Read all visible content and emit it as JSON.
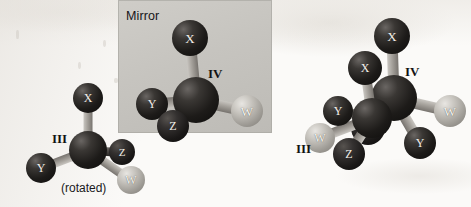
{
  "figure": {
    "width": 471,
    "height": 207,
    "background_color": "#fbfaf8",
    "description_type": "stereochemistry-mirror-image-figure"
  },
  "mirror": {
    "label": "Mirror",
    "plane_color": "#c6c4bf",
    "x": 118,
    "y": 0,
    "width": 154,
    "height": 133,
    "label_x": 126,
    "label_y": 9
  },
  "colors": {
    "dark_atom": "#1d1b19",
    "light_atom": "#c6c3bd",
    "bond_gray": "#a6a29c",
    "bond_dark": "#4a4744",
    "text_dark": "#131214"
  },
  "labels": [
    {
      "name": "label-III-left",
      "text": "III",
      "x": 52,
      "y": 131,
      "size": 13,
      "kind": "roman"
    },
    {
      "name": "caption-rotated",
      "text": "(rotated)",
      "x": 61,
      "y": 181,
      "size": 12,
      "kind": "caption"
    },
    {
      "name": "label-IV-middle",
      "text": "IV",
      "x": 208,
      "y": 66,
      "size": 13,
      "kind": "roman"
    },
    {
      "name": "label-IV-right",
      "text": "IV",
      "x": 405,
      "y": 64,
      "size": 13,
      "kind": "roman"
    },
    {
      "name": "label-III-right",
      "text": "III",
      "x": 296,
      "y": 141,
      "size": 13,
      "kind": "roman"
    }
  ],
  "molecules": [
    {
      "id": "III-left",
      "name": "molecule-iii-rotated",
      "label": "III",
      "caption": "(rotated)",
      "center_atom": {
        "name": "carbon-center",
        "label": "",
        "x": 88,
        "y": 150,
        "r": 19,
        "shade": "dark"
      },
      "substituents": [
        {
          "name": "atom-X",
          "label": "X",
          "x": 88,
          "y": 98,
          "r": 15,
          "shade": "dark",
          "font": 12,
          "bond": "gray"
        },
        {
          "name": "atom-Y",
          "label": "Y",
          "x": 41,
          "y": 168,
          "r": 15,
          "shade": "dark",
          "font": 12,
          "bond": "gray"
        },
        {
          "name": "atom-Z",
          "label": "Z",
          "x": 122,
          "y": 152,
          "r": 13,
          "shade": "mid",
          "font": 11,
          "bond": "dark"
        },
        {
          "name": "atom-W",
          "label": "W",
          "x": 131,
          "y": 180,
          "r": 14,
          "shade": "light",
          "font": 12,
          "bond": "gray"
        }
      ]
    },
    {
      "id": "IV-middle",
      "name": "molecule-iv-mirror-image",
      "label": "IV",
      "caption": "",
      "center_atom": {
        "name": "carbon-center",
        "label": "",
        "x": 196,
        "y": 100,
        "r": 23,
        "shade": "dark"
      },
      "substituents": [
        {
          "name": "atom-X",
          "label": "X",
          "x": 190,
          "y": 38,
          "r": 18,
          "shade": "dark",
          "font": 13,
          "bond": "gray"
        },
        {
          "name": "atom-Y",
          "label": "Y",
          "x": 152,
          "y": 104,
          "r": 16,
          "shade": "dark",
          "font": 12,
          "bond": "gray"
        },
        {
          "name": "atom-Z",
          "label": "Z",
          "x": 173,
          "y": 126,
          "r": 16,
          "shade": "mid",
          "font": 12,
          "bond": "gray"
        },
        {
          "name": "atom-W",
          "label": "W",
          "x": 247,
          "y": 111,
          "r": 16,
          "shade": "light",
          "font": 13,
          "bond": "gray"
        }
      ]
    },
    {
      "id": "IV-right",
      "name": "molecule-iv-overlapped",
      "label": "IV",
      "caption": "",
      "center_atom": {
        "name": "carbon-center",
        "label": "",
        "x": 394,
        "y": 98,
        "r": 23,
        "shade": "dark"
      },
      "substituents": [
        {
          "name": "atom-X",
          "label": "X",
          "x": 392,
          "y": 36,
          "r": 18,
          "shade": "dark",
          "font": 13,
          "bond": "gray"
        },
        {
          "name": "atom-Y",
          "label": "Y",
          "x": 420,
          "y": 143,
          "r": 16,
          "shade": "dark",
          "font": 12,
          "bond": "gray"
        },
        {
          "name": "atom-Z",
          "label": "Z",
          "x": 368,
          "y": 128,
          "r": 17,
          "shade": "mid",
          "font": 12,
          "bond": "dark"
        },
        {
          "name": "atom-W",
          "label": "W",
          "x": 450,
          "y": 111,
          "r": 16,
          "shade": "light",
          "font": 13,
          "bond": "gray"
        }
      ]
    },
    {
      "id": "III-right",
      "name": "molecule-iii-overlapped",
      "label": "III",
      "caption": "",
      "center_atom": {
        "name": "carbon-center",
        "label": "",
        "x": 372,
        "y": 118,
        "r": 20,
        "shade": "dark"
      },
      "substituents": [
        {
          "name": "atom-X",
          "label": "X",
          "x": 365,
          "y": 68,
          "r": 17,
          "shade": "dark",
          "font": 12,
          "bond": "gray"
        },
        {
          "name": "atom-Y",
          "label": "Y",
          "x": 338,
          "y": 111,
          "r": 15,
          "shade": "dark",
          "font": 12,
          "bond": "gray"
        },
        {
          "name": "atom-Z",
          "label": "Z",
          "x": 349,
          "y": 154,
          "r": 16,
          "shade": "mid",
          "font": 12,
          "bond": "gray"
        },
        {
          "name": "atom-W",
          "label": "W",
          "x": 320,
          "y": 138,
          "r": 15,
          "shade": "light",
          "font": 12,
          "bond": "gray"
        }
      ]
    }
  ],
  "smudges": [
    {
      "x": 16,
      "y": 30,
      "w": 3,
      "h": 9
    },
    {
      "x": 103,
      "y": 40,
      "w": 3,
      "h": 7
    },
    {
      "x": 78,
      "y": 62,
      "w": 3,
      "h": 7
    },
    {
      "x": 114,
      "y": 78,
      "w": 4,
      "h": 5
    }
  ]
}
